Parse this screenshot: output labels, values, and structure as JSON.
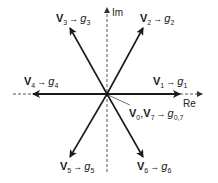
{
  "diagram": {
    "type": "space-vector-diagram",
    "axes": {
      "real_label": "Re",
      "imag_label": "Im"
    },
    "vectors": [
      {
        "id": "v1",
        "vector": "V",
        "index": "1",
        "maps_to": "g",
        "g_index": "1",
        "angle_deg": 0
      },
      {
        "id": "v2",
        "vector": "V",
        "index": "2",
        "maps_to": "g",
        "g_index": "2",
        "angle_deg": 60
      },
      {
        "id": "v3",
        "vector": "V",
        "index": "3",
        "maps_to": "g",
        "g_index": "3",
        "angle_deg": 120
      },
      {
        "id": "v4",
        "vector": "V",
        "index": "4",
        "maps_to": "g",
        "g_index": "4",
        "angle_deg": 180
      },
      {
        "id": "v5",
        "vector": "V",
        "index": "5",
        "maps_to": "g",
        "g_index": "5",
        "angle_deg": 240
      },
      {
        "id": "v6",
        "vector": "V",
        "index": "6",
        "maps_to": "g",
        "g_index": "6",
        "angle_deg": 300
      }
    ],
    "zero_vectors": {
      "vector_a": "V",
      "index_a": "0",
      "separator": ",",
      "vector_b": "V",
      "index_b": "7",
      "maps_to": "g",
      "g_index": "0,7"
    },
    "arrow_symbol": "→",
    "colors": {
      "line": "#1a1a1a",
      "axis": "#555555",
      "background": "#ffffff"
    }
  }
}
